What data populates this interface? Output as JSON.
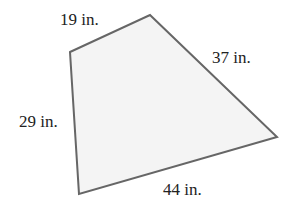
{
  "figure": {
    "shape": "quadrilateral",
    "fill_color": "#f4f4f4",
    "stroke_color": "#666666",
    "vertices": [
      {
        "name": "top-left",
        "x": 70,
        "y": 52
      },
      {
        "name": "top",
        "x": 150,
        "y": 15
      },
      {
        "name": "right",
        "x": 277,
        "y": 137
      },
      {
        "name": "bottom-left",
        "x": 79,
        "y": 194
      }
    ],
    "sides": {
      "top": "19 in.",
      "right": "37 in.",
      "left": "29 in.",
      "bottom": "44 in."
    }
  }
}
